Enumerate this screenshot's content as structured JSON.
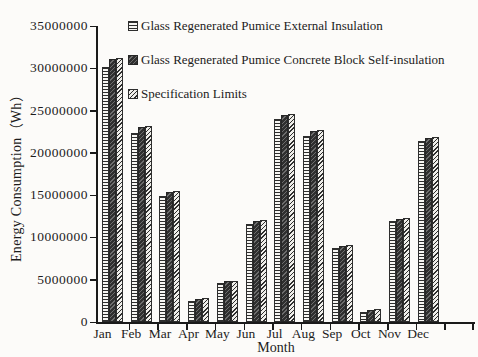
{
  "figure": {
    "background_color": "#fcfbf9",
    "ink_color": "#1a1a1a"
  },
  "chart_data": {
    "type": "bar",
    "title": "",
    "xlabel": "Month",
    "ylabel": "Energy Consumption（Wh）",
    "ylim": [
      0,
      35000000
    ],
    "ytick_step": 5000000,
    "yticks": [
      0,
      5000000,
      10000000,
      15000000,
      20000000,
      25000000,
      30000000,
      35000000
    ],
    "grid": false,
    "legend_position": "top-inside",
    "categories": [
      "Jan",
      "Feb",
      "Mar",
      "Apr",
      "May",
      "Jun",
      "Jul",
      "Aug",
      "Sep",
      "Oct",
      "Nov",
      "Dec"
    ],
    "series": [
      {
        "name": "Glass Regenerated Pumice External Insulation",
        "pattern": "horizontal-stripes",
        "values": [
          30200000,
          22400000,
          14900000,
          2500000,
          4600000,
          11600000,
          24000000,
          22000000,
          8800000,
          1200000,
          11900000,
          21400000
        ]
      },
      {
        "name": "Glass Regenerated Pumice Concrete Block Self-insulation",
        "pattern": "dark-solid",
        "values": [
          31100000,
          23100000,
          15400000,
          2700000,
          4800000,
          12000000,
          24500000,
          22600000,
          9000000,
          1400000,
          12200000,
          21800000
        ]
      },
      {
        "name": "Specification Limits",
        "pattern": "diagonal-hatch",
        "values": [
          31200000,
          23200000,
          15500000,
          2800000,
          4900000,
          12100000,
          24600000,
          22700000,
          9100000,
          1500000,
          12300000,
          21900000
        ]
      }
    ]
  }
}
